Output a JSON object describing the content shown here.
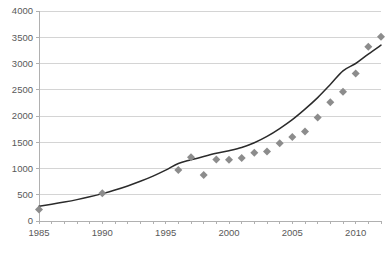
{
  "chart_data": {
    "type": "scatter",
    "title": "",
    "subtitle": "",
    "xlabel": "",
    "ylabel": "",
    "xlim": [
      1985,
      2012
    ],
    "ylim": [
      0,
      4000
    ],
    "grid": true,
    "legend": null,
    "y_ticks": [
      0,
      500,
      1000,
      1500,
      2000,
      2500,
      3000,
      3500,
      4000
    ],
    "y_tick_labels": [
      "0",
      "500",
      "1000",
      "1500",
      "2000",
      "2500",
      "3000",
      "3500",
      "4000"
    ],
    "x_ticks": [
      1985,
      1990,
      1995,
      2000,
      2005,
      2010
    ],
    "x_tick_labels": [
      "1985",
      "1990",
      "1995",
      "2000",
      "2005",
      "2010"
    ],
    "x_minor_step": 1,
    "series": [
      {
        "name": "data",
        "marker": "diamond",
        "color": "#8c8c8c",
        "points": [
          {
            "x": 1985,
            "y": 220
          },
          {
            "x": 1990,
            "y": 530
          },
          {
            "x": 1996,
            "y": 970
          },
          {
            "x": 1997,
            "y": 1215
          },
          {
            "x": 1998,
            "y": 875
          },
          {
            "x": 1999,
            "y": 1170
          },
          {
            "x": 2000,
            "y": 1165
          },
          {
            "x": 2001,
            "y": 1200
          },
          {
            "x": 2002,
            "y": 1300
          },
          {
            "x": 2003,
            "y": 1325
          },
          {
            "x": 2004,
            "y": 1480
          },
          {
            "x": 2005,
            "y": 1600
          },
          {
            "x": 2006,
            "y": 1705
          },
          {
            "x": 2007,
            "y": 1970
          },
          {
            "x": 2008,
            "y": 2260
          },
          {
            "x": 2009,
            "y": 2460
          },
          {
            "x": 2010,
            "y": 2810
          },
          {
            "x": 2011,
            "y": 3320
          },
          {
            "x": 2012,
            "y": 3510
          }
        ]
      }
    ],
    "trendline": {
      "name": "exponential-fit",
      "color": "#2b2b2b",
      "points": [
        {
          "x": 1985,
          "y": 280
        },
        {
          "x": 1986,
          "y": 318
        },
        {
          "x": 1987,
          "y": 360
        },
        {
          "x": 1988,
          "y": 407
        },
        {
          "x": 1989,
          "y": 461
        },
        {
          "x": 1990,
          "y": 521
        },
        {
          "x": 1991,
          "y": 590
        },
        {
          "x": 1992,
          "y": 668
        },
        {
          "x": 1993,
          "y": 756
        },
        {
          "x": 1994,
          "y": 855
        },
        {
          "x": 1995,
          "y": 968
        },
        {
          "x": 1996,
          "y": 1095
        },
        {
          "x": 1997,
          "y": 1165
        },
        {
          "x": 1998,
          "y": 1230
        },
        {
          "x": 1999,
          "y": 1290
        },
        {
          "x": 2000,
          "y": 1340
        },
        {
          "x": 2001,
          "y": 1400
        },
        {
          "x": 2002,
          "y": 1490
        },
        {
          "x": 2003,
          "y": 1610
        },
        {
          "x": 2004,
          "y": 1760
        },
        {
          "x": 2005,
          "y": 1930
        },
        {
          "x": 2006,
          "y": 2130
        },
        {
          "x": 2007,
          "y": 2350
        },
        {
          "x": 2008,
          "y": 2600
        },
        {
          "x": 2009,
          "y": 2860
        },
        {
          "x": 2010,
          "y": 3000
        },
        {
          "x": 2011,
          "y": 3180
        },
        {
          "x": 2012,
          "y": 3350
        }
      ]
    }
  },
  "layout": {
    "plot_left": 39,
    "plot_right": 381,
    "plot_top": 11,
    "plot_bottom": 221,
    "marker_size": 8
  }
}
